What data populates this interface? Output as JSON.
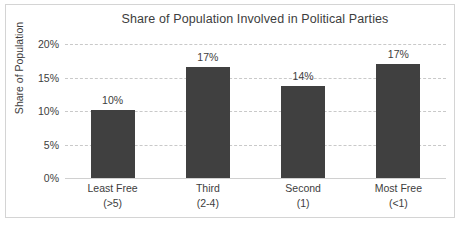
{
  "chart_data": {
    "type": "bar",
    "title": "Share of Population Involved in Political Parties",
    "xlabel": "",
    "ylabel": "Share of Population",
    "categories": [
      "Least Free\n(>5)",
      "Third\n(2-4)",
      "Second\n(1)",
      "Most Free\n(<1)"
    ],
    "category_lines": [
      {
        "line1": "Least Free",
        "line2": "(>5)"
      },
      {
        "line1": "Third",
        "line2": "(2-4)"
      },
      {
        "line1": "Second",
        "line2": "(1)"
      },
      {
        "line1": "Most Free",
        "line2": "(<1)"
      }
    ],
    "values": [
      10.2,
      16.5,
      13.7,
      17.0
    ],
    "data_labels": [
      "10%",
      "17%",
      "14%",
      "17%"
    ],
    "ylim": [
      0,
      20
    ],
    "yticks": [
      0,
      5,
      10,
      15,
      20
    ],
    "ytick_labels": [
      "0%",
      "5%",
      "10%",
      "15%",
      "20%"
    ],
    "grid": true,
    "legend": false,
    "bar_color": "#404040",
    "gridline_color": "#c9c9c9",
    "text_color": "#3d3d3d",
    "border_color": "#d4d4d4",
    "background_color": "#ffffff"
  }
}
